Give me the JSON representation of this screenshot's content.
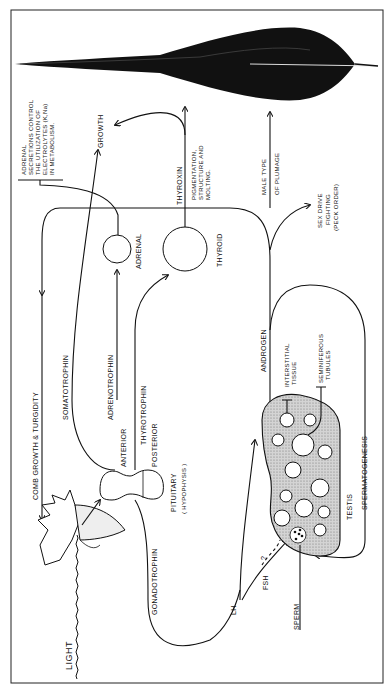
{
  "diagram": {
    "orientation": "rotated-90-ccw",
    "labels": {
      "light": "LIGHT",
      "comb_growth": "COMB GROWTH & TURGIDITY",
      "somatotrophin": "SOMATOTROPHIN",
      "adrenotrophin": "ADRENOTROPHIN",
      "anterior": "ANTERIOR",
      "thyrotrophin": "THYROTROPHIN",
      "posterior": "POSTERIOR",
      "pituitary": "PITUITARY",
      "hypophysis": "( HYPOPHYSIS )",
      "gonadotrophin": "GONADOTROPHIN",
      "lh": "LH",
      "fsh": "FSH",
      "question": "?",
      "sperm": "SPERM",
      "testis": "TESTIS",
      "spermatogenesis": "SPERMATOGENESIS",
      "interstitial_1": "INTERSTITIAL",
      "interstitial_2": "TISSUE",
      "seminiferous_1": "SEMINIFEROUS",
      "seminiferous_2": "TUBULES",
      "androgen": "ANDROGEN",
      "adrenal": "ADRENAL",
      "thyroid": "THYROID",
      "thyroxin": "THYROXIN",
      "pigmentation_1": "PIGMENTATION,",
      "pigmentation_2": "STRUCTURE AND",
      "pigmentation_3": "MOLTING.",
      "growth": "GROWTH",
      "male_plumage_1": "MALE TYPE",
      "male_plumage_2": "OF PLUMAGE",
      "sex_drive_1": "SEX DRIVE",
      "sex_drive_2": "FIGHTING",
      "sex_drive_3": "(PECK ORDER)",
      "adrenal_note_1": "ADRENAL",
      "adrenal_note_2": "SECRETIONS CONTROL",
      "adrenal_note_3": "THE UTILIZATION OF",
      "adrenal_note_4": "ELECTROLYTES (K,Na)",
      "adrenal_note_5": "IN METABOLISM."
    },
    "nodes": [
      "light",
      "rooster-head",
      "pituitary",
      "adrenal",
      "thyroid",
      "testis",
      "feather"
    ],
    "colors": {
      "ink": "#111111",
      "testis_fill": "#c8c8c8",
      "background": "#ffffff"
    }
  }
}
